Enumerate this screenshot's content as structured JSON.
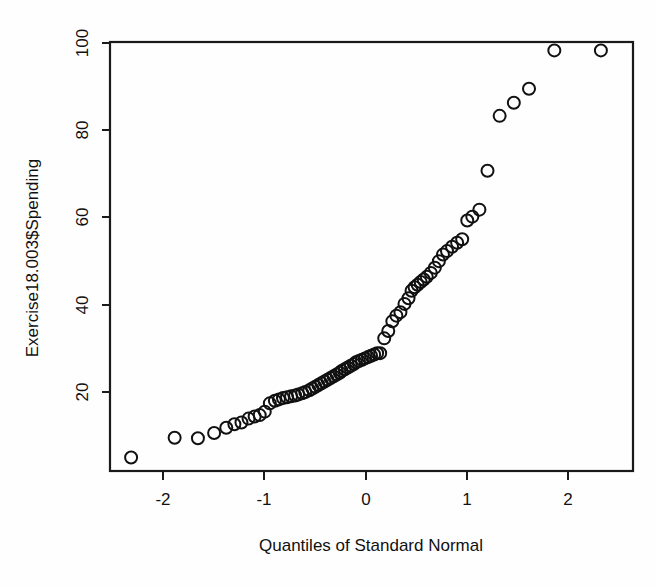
{
  "figure": {
    "background_color": "#fefefe",
    "ink_color": "#111111",
    "width": 656,
    "height": 587
  },
  "axes": {
    "y_title": "Exercise18.003$Spending",
    "x_title": "Quantiles of Standard Normal",
    "y_ticks": [
      "20",
      "40",
      "60",
      "80",
      "100"
    ],
    "x_ticks": [
      "-2",
      "-1",
      "0",
      "1",
      "2"
    ]
  },
  "chart_data": {
    "type": "scatter",
    "title": "",
    "xlabel": "Quantiles of Standard Normal",
    "ylabel": "Exercise18.003$Spending",
    "xlim": [
      -2.6,
      2.65
    ],
    "ylim": [
      2,
      103
    ],
    "xticks": [
      -2,
      -1,
      0,
      1,
      2
    ],
    "yticks": [
      20,
      40,
      60,
      80,
      100
    ],
    "grid": false,
    "legend": "none",
    "marker": "open-circle",
    "marker_size_px": 12,
    "annotations": [],
    "x": [
      -2.32,
      -1.89,
      -1.66,
      -1.5,
      -1.38,
      -1.3,
      -1.23,
      -1.16,
      -1.1,
      -1.05,
      -1.0,
      -0.95,
      -0.9,
      -0.86,
      -0.82,
      -0.78,
      -0.74,
      -0.7,
      -0.67,
      -0.63,
      -0.6,
      -0.56,
      -0.53,
      -0.5,
      -0.47,
      -0.44,
      -0.41,
      -0.38,
      -0.35,
      -0.32,
      -0.29,
      -0.26,
      -0.24,
      -0.21,
      -0.18,
      -0.15,
      -0.12,
      -0.1,
      -0.07,
      -0.04,
      -0.01,
      0.02,
      0.05,
      0.08,
      0.11,
      0.14,
      0.18,
      0.22,
      0.26,
      0.3,
      0.34,
      0.38,
      0.42,
      0.45,
      0.48,
      0.51,
      0.54,
      0.57,
      0.6,
      0.64,
      0.68,
      0.72,
      0.76,
      0.8,
      0.85,
      0.9,
      0.95,
      1.0,
      1.05,
      1.12,
      1.2,
      1.32,
      1.46,
      1.61,
      1.86,
      2.32
    ],
    "y": [
      5.0,
      9.5,
      9.4,
      10.6,
      11.8,
      12.6,
      13.0,
      13.9,
      14.4,
      14.7,
      15.5,
      17.4,
      18.0,
      18.3,
      18.6,
      18.8,
      19.0,
      19.2,
      19.4,
      19.7,
      20.0,
      20.4,
      20.8,
      21.2,
      21.6,
      22.0,
      22.4,
      22.8,
      23.2,
      23.6,
      24.0,
      24.4,
      24.8,
      25.2,
      25.6,
      26.0,
      26.4,
      26.8,
      27.1,
      27.4,
      27.7,
      28.0,
      28.3,
      28.6,
      28.9,
      28.9,
      32.3,
      34.0,
      36.2,
      37.5,
      38.3,
      40.2,
      41.5,
      43.2,
      44.0,
      44.6,
      45.2,
      45.8,
      46.4,
      47.3,
      48.5,
      50.0,
      51.5,
      52.3,
      53.3,
      54.2,
      55.0,
      59.3,
      60.2,
      61.8,
      70.7,
      83.3,
      86.3,
      89.5,
      98.3,
      98.3
    ]
  }
}
